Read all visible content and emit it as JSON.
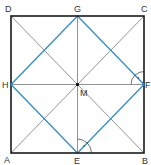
{
  "diagram": {
    "title": "",
    "colors": {
      "square": "#1a1a1a",
      "construction_lines": "#666666",
      "inscribed_square": "#3a8fc4",
      "labels": "#333333"
    },
    "points": {
      "A": {
        "label": "A",
        "x": 11,
        "y": 153
      },
      "B": {
        "label": "B",
        "x": 144,
        "y": 153
      },
      "C": {
        "label": "C",
        "x": 144,
        "y": 16
      },
      "D": {
        "label": "D",
        "x": 11,
        "y": 16
      },
      "E": {
        "label": "E",
        "x": 77.5,
        "y": 153
      },
      "F": {
        "label": "F",
        "x": 144,
        "y": 84.5
      },
      "G": {
        "label": "G",
        "x": 77.5,
        "y": 16
      },
      "H": {
        "label": "H",
        "x": 11,
        "y": 84.5
      },
      "M": {
        "label": "M",
        "x": 77.5,
        "y": 84.5
      }
    },
    "outer_square": [
      "A",
      "B",
      "C",
      "D"
    ],
    "inscribed_square": [
      "E",
      "F",
      "G",
      "H"
    ],
    "diagonals": [
      [
        "A",
        "C"
      ],
      [
        "B",
        "D"
      ]
    ],
    "midlines": [
      [
        "E",
        "G"
      ],
      [
        "H",
        "F"
      ]
    ],
    "right_angle_marks": [
      {
        "vertex": "E",
        "description": "angle between ME and EF"
      },
      {
        "vertex": "F",
        "description": "angle between FM and FG"
      }
    ]
  }
}
